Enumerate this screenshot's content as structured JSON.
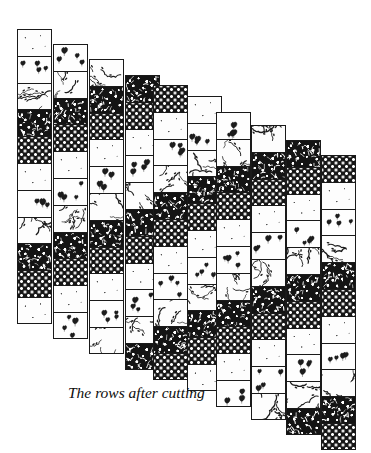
{
  "figure": {
    "caption": "The rows after cutting",
    "caption_x": 68,
    "caption_y": 384,
    "caption_font_size": 15.5,
    "background_color": "#ffffff",
    "ink_color": "#1a1a1a",
    "strip_count": 10,
    "strip_width": 35,
    "cell_height": 26.8,
    "strip_pitch_x": 36.8,
    "strip_step_y": 15.5,
    "first_strip_x": 17,
    "first_strip_y": 29
  },
  "fabrics": [
    {
      "id": "plain",
      "label": "plain light fabric",
      "class": "fab-plain",
      "tone": "light"
    },
    {
      "id": "floral",
      "label": "small floral sprig print",
      "class": "fab-floral",
      "tone": "light"
    },
    {
      "id": "vine",
      "label": "dark branching vine print",
      "class": "fab-vine",
      "tone": "light"
    },
    {
      "id": "mottle",
      "label": "dense dark mottled print",
      "class": "fab-mottle",
      "tone": "dark"
    },
    {
      "id": "dot",
      "label": "dark polka dot print",
      "class": "fab-dot",
      "tone": "dark"
    }
  ],
  "strips": [
    {
      "index": 1,
      "x": 17,
      "y": 29,
      "cells": 11,
      "sequence": [
        "plain",
        "floral",
        "vine",
        "mottle",
        "dot",
        "plain",
        "floral",
        "vine",
        "mottle",
        "dot",
        "plain"
      ]
    },
    {
      "index": 2,
      "x": 53,
      "y": 44,
      "cells": 11,
      "sequence": [
        "floral",
        "vine",
        "mottle",
        "dot",
        "plain",
        "floral",
        "vine",
        "mottle",
        "dot",
        "plain",
        "floral"
      ]
    },
    {
      "index": 3,
      "x": 89,
      "y": 59,
      "cells": 11,
      "sequence": [
        "vine",
        "mottle",
        "dot",
        "plain",
        "floral",
        "vine",
        "mottle",
        "dot",
        "plain",
        "floral",
        "vine"
      ]
    },
    {
      "index": 4,
      "x": 125,
      "y": 75,
      "cells": 11,
      "sequence": [
        "mottle",
        "dot",
        "plain",
        "floral",
        "vine",
        "mottle",
        "dot",
        "plain",
        "floral",
        "vine",
        "mottle"
      ]
    },
    {
      "index": 5,
      "x": 153,
      "y": 85,
      "cells": 11,
      "sequence": [
        "dot",
        "plain",
        "floral",
        "vine",
        "mottle",
        "dot",
        "plain",
        "floral",
        "vine",
        "mottle",
        "dot"
      ]
    },
    {
      "index": 6,
      "x": 187,
      "y": 96,
      "cells": 11,
      "sequence": [
        "plain",
        "floral",
        "vine",
        "mottle",
        "dot",
        "plain",
        "floral",
        "vine",
        "mottle",
        "dot",
        "plain"
      ]
    },
    {
      "index": 7,
      "x": 216,
      "y": 112,
      "cells": 11,
      "sequence": [
        "floral",
        "vine",
        "mottle",
        "dot",
        "plain",
        "floral",
        "vine",
        "mottle",
        "dot",
        "plain",
        "floral"
      ]
    },
    {
      "index": 8,
      "x": 251,
      "y": 125,
      "cells": 11,
      "sequence": [
        "vine",
        "mottle",
        "dot",
        "plain",
        "floral",
        "vine",
        "mottle",
        "dot",
        "plain",
        "floral",
        "vine"
      ]
    },
    {
      "index": 9,
      "x": 286,
      "y": 140,
      "cells": 11,
      "sequence": [
        "mottle",
        "dot",
        "plain",
        "floral",
        "vine",
        "mottle",
        "dot",
        "plain",
        "floral",
        "vine",
        "mottle"
      ]
    },
    {
      "index": 10,
      "x": 321,
      "y": 155,
      "cells": 11,
      "sequence": [
        "dot",
        "plain",
        "floral",
        "vine",
        "mottle",
        "dot",
        "plain",
        "floral",
        "vine",
        "mottle",
        "dot"
      ]
    }
  ]
}
